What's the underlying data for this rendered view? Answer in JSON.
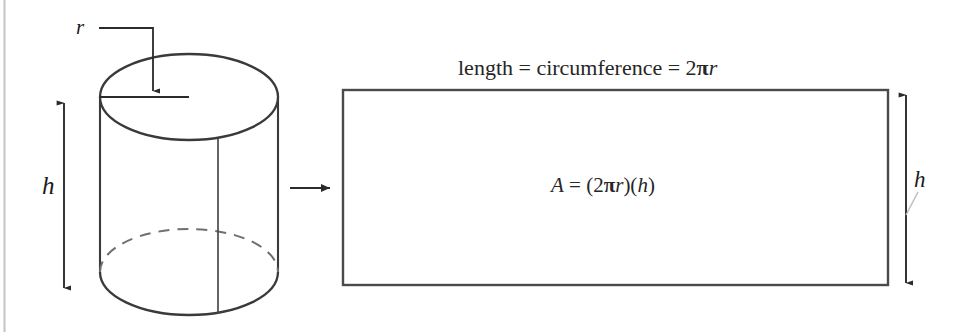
{
  "figure": {
    "background_color": "#ffffff",
    "ink_color": "#3a3a3a",
    "text_color": "#262626"
  },
  "cylinder": {
    "name": "right circular cylinder",
    "radius_label": "r",
    "height_label": "h",
    "top_face": "ellipse",
    "hidden_edge_style": "dashed",
    "seam_line": "vertical"
  },
  "transform_arrow": {
    "icon": "arrow-right-icon",
    "direction": "right"
  },
  "rectangle": {
    "top_label_parts": {
      "text_before": "length = circumference = 2",
      "pi": "π",
      "text_after": "r"
    },
    "top_label_full": "length = circumference = 2πr",
    "area_formula_parts": {
      "area_symbol": "A",
      "equals": " = (2",
      "pi": "π",
      "radius": "r",
      "middle": ")(",
      "height": "h",
      "close": ")"
    },
    "area_formula_full": "A = (2πr)(h)",
    "height_label": "h",
    "border_color": "#4a4a4a"
  },
  "dimension_arrows": {
    "cylinder_height": "double-headed-vertical-arrow",
    "rectangle_height": "double-headed-vertical-arrow",
    "radius_leader": "leader-line-with-arrowhead"
  }
}
